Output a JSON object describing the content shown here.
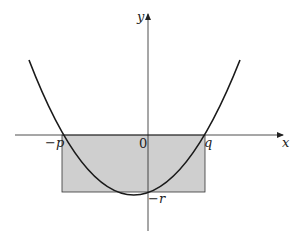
{
  "diagram": {
    "title": "",
    "axes": {
      "x_label": "x",
      "y_label": "y",
      "origin_label": "0"
    },
    "points": {
      "left_root": "−p",
      "right_root": "q",
      "y_intercept": "−r"
    },
    "shape": {
      "type": "parabola",
      "description": "upward parabola crossing x-axis at -p and q, y-intercept -r"
    },
    "shaded_region": {
      "type": "rectangle",
      "from_x": "-p",
      "to_x": "q",
      "from_y": "-r",
      "to_y": "0",
      "fill": "#cfcfcf"
    },
    "colors": {
      "line": "#222222",
      "fill": "#cfcfcf"
    }
  }
}
